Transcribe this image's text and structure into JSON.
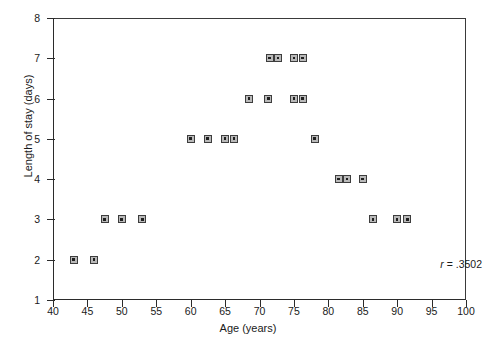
{
  "chart_data": {
    "type": "scatter",
    "title": "",
    "xlabel": "Age (years)",
    "ylabel": "Length of stay (days)",
    "xlim": [
      40,
      100
    ],
    "ylim": [
      1,
      8
    ],
    "xticks": [
      40,
      45,
      50,
      55,
      60,
      65,
      70,
      75,
      80,
      85,
      90,
      95,
      100
    ],
    "yticks": [
      1,
      2,
      3,
      4,
      5,
      6,
      7,
      8
    ],
    "grid": false,
    "legend": null,
    "annotations": [
      {
        "name": "correlation-coefficient",
        "symbol": "r",
        "relation": "=",
        "value": ".3502",
        "text": "r = .3502"
      }
    ],
    "marker": {
      "shape": "square-with-center-dot",
      "fill": "#b9b9b9",
      "edge": "#3d3d3d",
      "size_px": 8
    },
    "points": [
      {
        "x": 43,
        "y": 2
      },
      {
        "x": 46,
        "y": 2
      },
      {
        "x": 47.5,
        "y": 3
      },
      {
        "x": 50,
        "y": 3
      },
      {
        "x": 53,
        "y": 3
      },
      {
        "x": 60,
        "y": 5
      },
      {
        "x": 62.5,
        "y": 5
      },
      {
        "x": 65,
        "y": 5
      },
      {
        "x": 66.3,
        "y": 5
      },
      {
        "x": 68.5,
        "y": 6
      },
      {
        "x": 71.3,
        "y": 6
      },
      {
        "x": 71.5,
        "y": 7
      },
      {
        "x": 72.7,
        "y": 7
      },
      {
        "x": 75,
        "y": 7
      },
      {
        "x": 76.3,
        "y": 7
      },
      {
        "x": 75,
        "y": 6
      },
      {
        "x": 76.3,
        "y": 6
      },
      {
        "x": 78,
        "y": 5
      },
      {
        "x": 81.5,
        "y": 4
      },
      {
        "x": 82.7,
        "y": 4
      },
      {
        "x": 85,
        "y": 4
      },
      {
        "x": 86.5,
        "y": 3
      },
      {
        "x": 90,
        "y": 3
      },
      {
        "x": 91.5,
        "y": 3
      }
    ]
  }
}
